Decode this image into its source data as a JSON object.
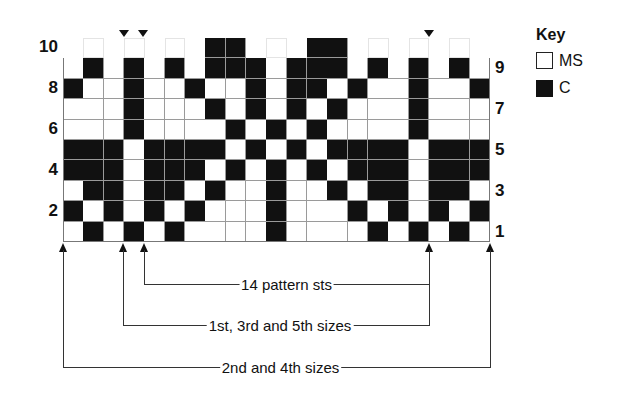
{
  "key": {
    "title": "Key",
    "items": [
      {
        "symbol": "white-square",
        "label": "MS",
        "color": "#ffffff"
      },
      {
        "symbol": "black-square",
        "label": "C",
        "color": "#111111"
      }
    ]
  },
  "row_labels_left": [
    "10",
    "8",
    "6",
    "4",
    "2"
  ],
  "row_labels_right": [
    "9",
    "7",
    "5",
    "3",
    "1"
  ],
  "grid": {
    "columns": 21,
    "rows": [
      {
        "row": 10,
        "cells": "-g-g-g-BB--g-BB-g-g-g-"
      },
      {
        "row": 9,
        "cells": "WBWBWBWBBBWBBBWBWBWBW"
      },
      {
        "row": 8,
        "cells": "BWWBWWBWWBWBBWBWWBWWB"
      },
      {
        "row": 7,
        "cells": "WWWBWWWBWBWBWBWWWBWWW"
      },
      {
        "row": 6,
        "cells": "WWWBWWWWBWBWBWWWWBWWW"
      },
      {
        "row": 5,
        "cells": "BBBWBBBBWBWBWBBBBWBBB"
      },
      {
        "row": 4,
        "cells": "BBBWBBBWBWBWBWBBBWBBB"
      },
      {
        "row": 3,
        "cells": "WBBWBBWBWWBWWBWBBWBBW"
      },
      {
        "row": 2,
        "cells": "BWBWBWBWWWBWWWBWBWBWB"
      },
      {
        "row": 1,
        "cells": "WBWBWBWWWWBWWWWBWBWBW"
      }
    ]
  },
  "markers": {
    "top_arrows_x": [
      124,
      143,
      429
    ],
    "bottom_arrows_x": [
      63,
      123,
      144,
      429,
      490
    ]
  },
  "brackets": [
    {
      "label": "14 pattern sts",
      "x1": 144,
      "x2": 429,
      "y": 284
    },
    {
      "label": "1st, 3rd and 5th sizes",
      "x1": 123,
      "x2": 429,
      "y": 325
    },
    {
      "label": "2nd and 4th sizes",
      "x1": 63,
      "x2": 490,
      "y": 367
    }
  ]
}
